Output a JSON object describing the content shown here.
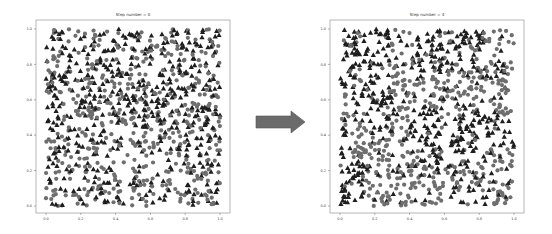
{
  "figure": {
    "arrow": {
      "color": "#6b6b6b",
      "direction": "right"
    }
  },
  "chart_data": [
    {
      "type": "scatter",
      "title": "Step number = 0",
      "xlabel": "",
      "ylabel": "",
      "xlim": [
        0.0,
        1.0
      ],
      "ylim": [
        0.0,
        1.0
      ],
      "x_ticks": [
        "0.0",
        "0.2",
        "0.4",
        "0.6",
        "0.8",
        "1.0"
      ],
      "y_ticks": [
        "0.0",
        "0.2",
        "0.4",
        "0.6",
        "0.8",
        "1.0"
      ],
      "grid": false,
      "legend": null,
      "series": [
        {
          "name": "group A",
          "marker": "circle",
          "color": "#6e6e6e",
          "count_approx": 500,
          "distribution": "uniform random"
        },
        {
          "name": "group B",
          "marker": "triangle",
          "color": "#1e1e1e",
          "count_approx": 500,
          "distribution": "uniform random"
        }
      ],
      "seed": 11,
      "clustering": 0
    },
    {
      "type": "scatter",
      "title": "Step number = 4",
      "xlabel": "",
      "ylabel": "",
      "xlim": [
        0.0,
        1.0
      ],
      "ylim": [
        0.0,
        1.0
      ],
      "x_ticks": [
        "0.0",
        "0.2",
        "0.4",
        "0.6",
        "0.8",
        "1.0"
      ],
      "y_ticks": [
        "0.0",
        "0.2",
        "0.4",
        "0.6",
        "0.8",
        "1.0"
      ],
      "grid": false,
      "legend": null,
      "series": [
        {
          "name": "group A",
          "marker": "circle",
          "color": "#6e6e6e",
          "count_approx": 500,
          "distribution": "clustered"
        },
        {
          "name": "group B",
          "marker": "triangle",
          "color": "#1e1e1e",
          "count_approx": 500,
          "distribution": "clustered"
        }
      ],
      "seed": 29,
      "clustering": 1
    }
  ]
}
